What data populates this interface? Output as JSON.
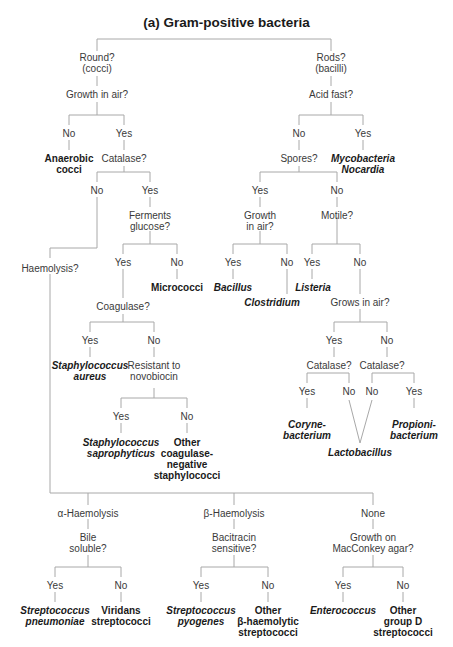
{
  "title": "(a) Gram-positive bacteria",
  "line_color": "#a8a8a8",
  "nodes": {
    "round": "Round?\n(cocci)",
    "rods": "Rods?\n(bacilli)",
    "growth_air_cocci": "Growth in air?",
    "acid_fast": "Acid fast?",
    "cocci_no": "No",
    "cocci_yes": "Yes",
    "anaerobic_cocci": "Anaerobic\ncocci",
    "catalase_cocci": "Catalase?",
    "acid_no": "No",
    "acid_yes": "Yes",
    "spores": "Spores?",
    "mycobacteria": "Mycobacteria\nNocardia",
    "catalase_no": "No",
    "catalase_yes": "Yes",
    "ferments_glucose": "Ferments\nglucose?",
    "spores_yes": "Yes",
    "spores_no": "No",
    "growth_in_air_bac": "Growth\nin air?",
    "motile": "Motile?",
    "haemolysis": "Haemolysis?",
    "ferm_yes": "Yes",
    "ferm_no": "No",
    "micrococci": "Micrococci",
    "gia_yes": "Yes",
    "gia_no": "No",
    "bacillus": "Bacillus",
    "clostridium": "Clostridium",
    "motile_yes": "Yes",
    "motile_no": "No",
    "listeria": "Listeria",
    "grows_in_air": "Grows in air?",
    "coagulase": "Coagulase?",
    "coag_yes": "Yes",
    "coag_no": "No",
    "staph_aureus": "Staphylococcus\naureus",
    "novobiocin": "Resistant to\nnovobiocin",
    "gra_yes": "Yes",
    "gra_no": "No",
    "catalase_l": "Catalase?",
    "catalase_r": "Catalase?",
    "cat_l_yes": "Yes",
    "cat_l_no": "No",
    "cat_r_no": "No",
    "cat_r_yes": "Yes",
    "corynebacterium": "Coryne-\nbacterium",
    "propionibacterium": "Propioni-\nbacterium",
    "lactobacillus": "Lactobacillus",
    "novo_yes": "Yes",
    "novo_no": "No",
    "staph_saprophyticus": "Staphylococcus\nsaprophyticus",
    "other_coag_neg": "Other\ncoagulase-\nnegative\nstaphylococci",
    "alpha": "α-Haemolysis",
    "beta": "β-Haemolysis",
    "none": "None",
    "bile_soluble": "Bile\nsoluble?",
    "bacitracin": "Bacitracin\nsensitive?",
    "maconkey": "Growth on\nMacConkey agar?",
    "bile_yes": "Yes",
    "bile_no": "No",
    "baci_yes": "Yes",
    "baci_no": "No",
    "mac_yes": "Yes",
    "mac_no": "No",
    "strep_pneumoniae": "Streptococcus\npneumoniae",
    "viridans": "Viridans\nstreptococci",
    "strep_pyogenes": "Streptococcus\npyogenes",
    "other_beta": "Other\nβ-haemolytic\nstreptococci",
    "enterococcus": "Enterococcus",
    "other_group_d": "Other\ngroup D\nstreptococci"
  }
}
